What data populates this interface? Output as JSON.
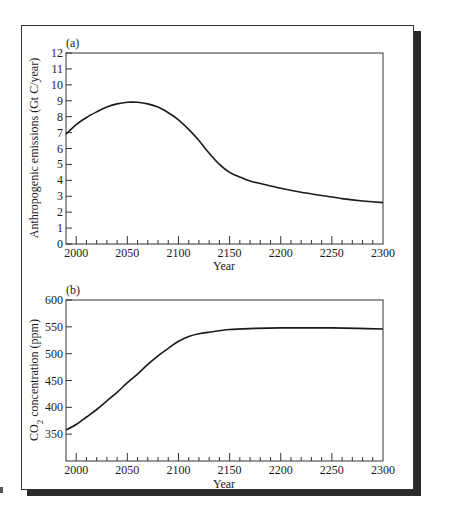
{
  "chart_data": [
    {
      "type": "line",
      "panel_label": "(a)",
      "title": "",
      "xlabel": "Year",
      "ylabel": "Anthropogenic emissions (Gt C/year)",
      "xlim": [
        1990,
        2300
      ],
      "ylim": [
        0,
        12
      ],
      "x_ticks": [
        2000,
        2050,
        2100,
        2150,
        2200,
        2250,
        2300
      ],
      "y_ticks": [
        0,
        1,
        2,
        3,
        4,
        5,
        6,
        7,
        8,
        9,
        10,
        11,
        12
      ],
      "grid": false,
      "legend": "none",
      "series": [
        {
          "name": "Emissions",
          "x": [
            1990,
            2000,
            2010,
            2020,
            2030,
            2040,
            2050,
            2060,
            2070,
            2080,
            2090,
            2100,
            2110,
            2120,
            2130,
            2140,
            2150,
            2160,
            2170,
            2180,
            2200,
            2220,
            2240,
            2260,
            2280,
            2300
          ],
          "values": [
            6.9,
            7.5,
            7.95,
            8.3,
            8.6,
            8.8,
            8.9,
            8.9,
            8.8,
            8.6,
            8.25,
            7.8,
            7.2,
            6.5,
            5.7,
            5.0,
            4.5,
            4.2,
            3.95,
            3.8,
            3.5,
            3.25,
            3.05,
            2.85,
            2.7,
            2.6
          ]
        }
      ]
    },
    {
      "type": "line",
      "panel_label": "(b)",
      "title": "",
      "xlabel": "Year",
      "ylabel": "CO2 concentration (ppm)",
      "xlim": [
        1990,
        2300
      ],
      "ylim": [
        300,
        600
      ],
      "x_ticks": [
        2000,
        2050,
        2100,
        2150,
        2200,
        2250,
        2300
      ],
      "y_ticks": [
        350,
        400,
        450,
        500,
        550,
        600
      ],
      "grid": false,
      "legend": "none",
      "series": [
        {
          "name": "CO2 concentration",
          "x": [
            1990,
            2000,
            2010,
            2020,
            2030,
            2040,
            2050,
            2060,
            2070,
            2080,
            2090,
            2100,
            2110,
            2120,
            2130,
            2150,
            2175,
            2200,
            2225,
            2250,
            2275,
            2300
          ],
          "values": [
            358,
            368,
            382,
            396,
            412,
            428,
            446,
            462,
            480,
            496,
            510,
            523,
            532,
            537,
            540,
            545,
            547,
            548,
            548,
            548,
            547,
            546
          ]
        }
      ]
    }
  ],
  "panels": {
    "a": {
      "label": "(a)",
      "ylabel": "Anthropogenic emissions (Gt C/year)",
      "xlabel": "Year"
    },
    "b": {
      "label": "(b)",
      "ylabel_main": "CO",
      "ylabel_sub": "2",
      "ylabel_rest": " concentration (ppm)",
      "xlabel": "Year"
    }
  }
}
